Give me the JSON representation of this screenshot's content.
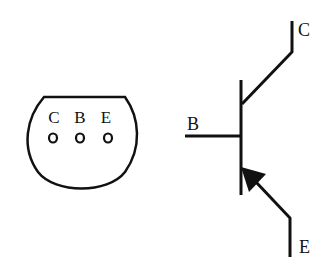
{
  "package": {
    "pins": [
      {
        "label": "C",
        "x": 54
      },
      {
        "label": "B",
        "x": 79
      },
      {
        "label": "E",
        "x": 104
      }
    ]
  },
  "symbol": {
    "type": "PNP transistor",
    "collector_label": "C",
    "base_label": "B",
    "emitter_label": "E"
  },
  "colors": {
    "stroke": "#111111",
    "background": "#ffffff"
  }
}
